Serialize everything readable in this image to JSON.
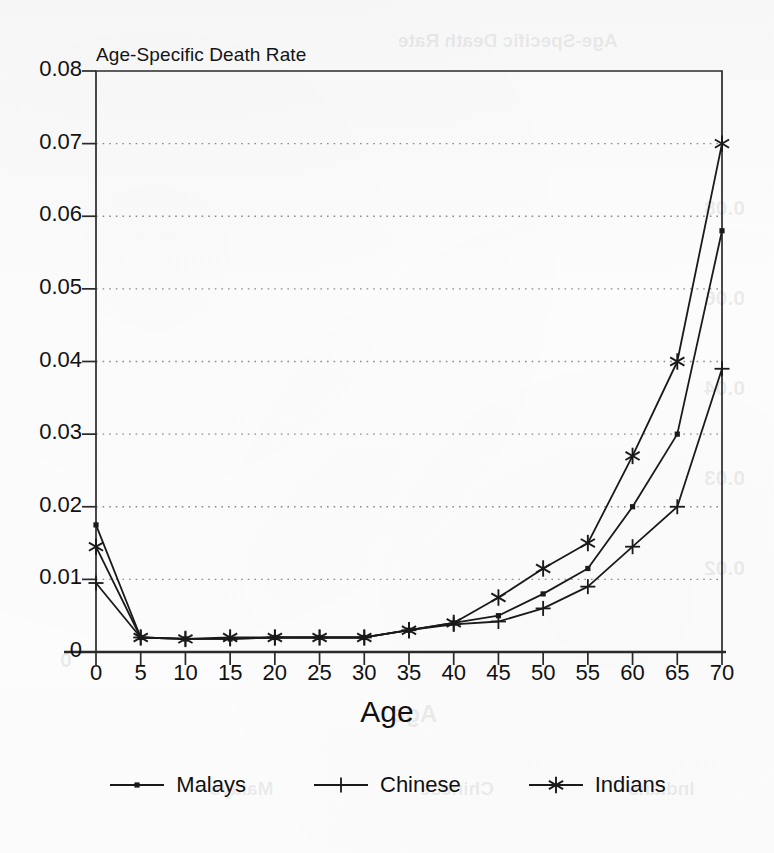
{
  "chart_data": {
    "type": "line",
    "title": "Age-Specific Death Rate",
    "xlabel": "Age",
    "ylabel": "",
    "x": [
      0,
      5,
      10,
      15,
      20,
      25,
      30,
      35,
      40,
      45,
      50,
      55,
      60,
      65,
      70
    ],
    "xlim": [
      0,
      70
    ],
    "ylim": [
      0,
      0.08
    ],
    "xticks": [
      "0",
      "5",
      "10",
      "15",
      "20",
      "25",
      "30",
      "35",
      "40",
      "45",
      "50",
      "55",
      "60",
      "65",
      "70"
    ],
    "yticks": [
      "0",
      "0.01",
      "0.02",
      "0.03",
      "0.04",
      "0.05",
      "0.06",
      "0.07",
      "0.08"
    ],
    "ytick_values": [
      0,
      0.01,
      0.02,
      0.03,
      0.04,
      0.05,
      0.06,
      0.07,
      0.08
    ],
    "grid": "horizontal-dotted",
    "legend_position": "bottom-center",
    "series": [
      {
        "name": "Malays",
        "marker": "dot",
        "values": [
          0.0175,
          0.002,
          0.0018,
          0.0018,
          0.002,
          0.002,
          0.002,
          0.003,
          0.004,
          0.005,
          0.008,
          0.0115,
          0.02,
          0.03,
          0.058
        ]
      },
      {
        "name": "Chinese",
        "marker": "plus",
        "values": [
          0.0095,
          0.002,
          0.0018,
          0.0018,
          0.002,
          0.002,
          0.002,
          0.003,
          0.0038,
          0.0042,
          0.006,
          0.009,
          0.0145,
          0.02,
          0.039
        ]
      },
      {
        "name": "Indians",
        "marker": "asterisk",
        "values": [
          0.0145,
          0.002,
          0.0018,
          0.002,
          0.002,
          0.002,
          0.002,
          0.003,
          0.004,
          0.0075,
          0.0115,
          0.015,
          0.027,
          0.04,
          0.07
        ]
      }
    ]
  },
  "colors": {
    "line": "#1a1a1a",
    "grid": "#8a8a8a",
    "axis": "#2a2a2a",
    "text": "#111111",
    "background": "#fbfbfb"
  },
  "legend": {
    "items": [
      {
        "label": "Malays"
      },
      {
        "label": "Chinese"
      },
      {
        "label": "Indians"
      }
    ]
  },
  "ghost_text": {
    "title": "Age-Specific Death Rate",
    "xlabel": "Age",
    "y1": "0.08",
    "y2": "0.06",
    "y3": "0.04",
    "y4": "0.03",
    "y5": "0.02",
    "y6": "0",
    "legend1": "Malays",
    "legend2": "Chinese",
    "legend3": "Indians"
  }
}
